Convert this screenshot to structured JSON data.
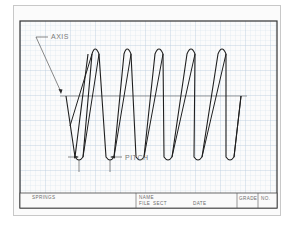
{
  "drawing": {
    "title": "Helical spring drawing",
    "labels": {
      "axis": "AXIS",
      "pitch": "PITCH"
    },
    "spring": {
      "coil_count": 5,
      "top_loop_x": [
        95,
        127,
        159,
        191,
        222
      ],
      "bottom_loop_x": [
        79,
        110,
        139,
        167,
        198,
        229
      ]
    }
  },
  "title_block": {
    "subject": "SPRINGS",
    "name_label": "NAME",
    "file_label": "FILE",
    "sect_label": "SECT",
    "date_label": "DATE",
    "grade_label": "GRADE",
    "no_label": "NO."
  },
  "colors": {
    "grid": "#c9d9e8",
    "grid_major": "#a9c1d8",
    "ink": "#1e1e1e",
    "border": "#333333",
    "paper": "#fbfbfb"
  }
}
